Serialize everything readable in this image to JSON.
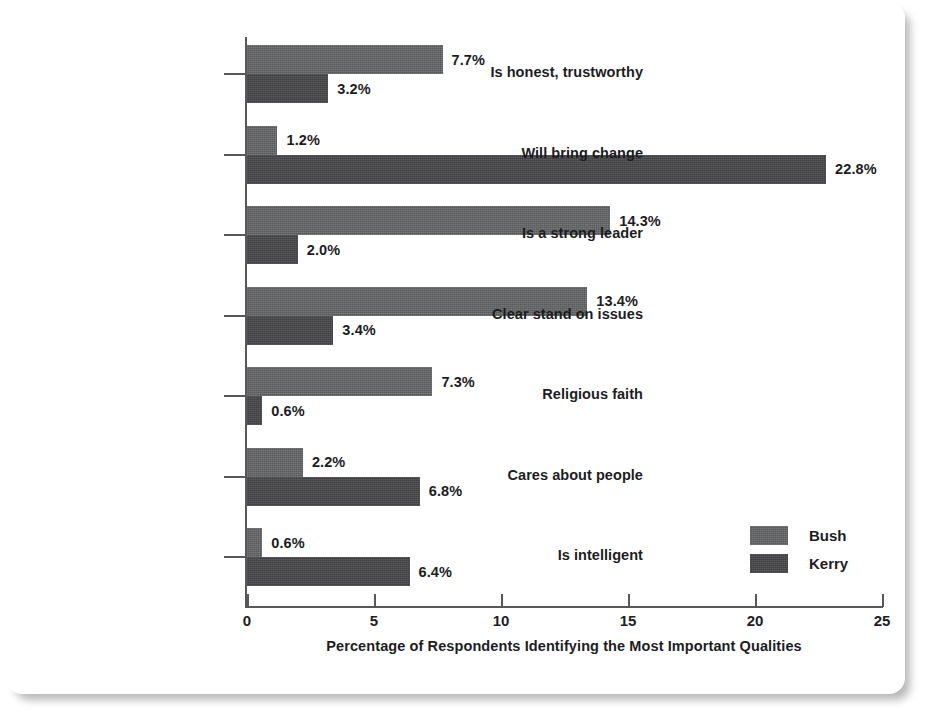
{
  "chart_data": {
    "type": "bar",
    "orientation": "horizontal",
    "title": "",
    "subtitle": "",
    "xlabel": "Percentage of Respondents Identifying the Most Important Qualities",
    "ylabel": "",
    "xlim": [
      0,
      25
    ],
    "xticks": [
      0,
      5,
      10,
      15,
      20,
      25
    ],
    "xtick_labels": [
      "0",
      "5",
      "10",
      "15",
      "20",
      "25"
    ],
    "grid": false,
    "legend_position": "inside-right-lower",
    "categories": [
      "Is honest, trustworthy",
      "Will bring change",
      "Is a strong leader",
      "Clear stand on issues",
      "Religious faith",
      "Cares about people",
      "Is intelligent"
    ],
    "series": [
      {
        "name": "Bush",
        "color": "#595a5c",
        "values": [
          7.7,
          1.2,
          14.3,
          13.4,
          7.3,
          2.2,
          0.6
        ],
        "value_labels": [
          "7.7%",
          "1.2%",
          "14.3%",
          "13.4%",
          "7.3%",
          "2.2%",
          "0.6%"
        ]
      },
      {
        "name": "Kerry",
        "color": "#404042",
        "values": [
          3.2,
          22.8,
          2.0,
          3.4,
          0.6,
          6.8,
          6.4
        ],
        "value_labels": [
          "3.2%",
          "22.8%",
          "2.0%",
          "3.4%",
          "0.6%",
          "6.8%",
          "6.4%"
        ]
      }
    ]
  },
  "legend": {
    "items": [
      {
        "label": "Bush",
        "color": "#595a5c"
      },
      {
        "label": "Kerry",
        "color": "#404042"
      }
    ]
  },
  "axis": {
    "x_title": "Percentage of Respondents Identifying the Most Important Qualities"
  }
}
